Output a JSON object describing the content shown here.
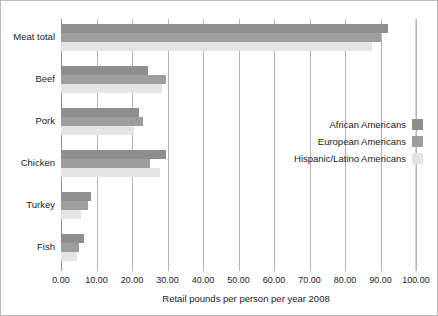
{
  "chart_data": {
    "type": "bar",
    "orientation": "horizontal",
    "title": "",
    "xlabel": "Retail pounds per person per year 2008",
    "ylabel": "",
    "xlim": [
      0,
      100
    ],
    "xticks": [
      "0.00",
      "10.00",
      "20.00",
      "30.00",
      "40.00",
      "50.00",
      "60.00",
      "70.00",
      "80.00",
      "90.00",
      "100.00"
    ],
    "grid": true,
    "legend_position": "center-right",
    "categories": [
      "Meat total",
      "Beef",
      "Pork",
      "Chicken",
      "Turkey",
      "Fish"
    ],
    "series": [
      {
        "name": "African Americans",
        "color": "#8e8e8e",
        "values": [
          92.0,
          24.5,
          22.0,
          29.5,
          8.5,
          6.5
        ]
      },
      {
        "name": "European Americans",
        "color": "#9e9e9e",
        "values": [
          90.0,
          29.5,
          23.0,
          25.0,
          7.5,
          5.0
        ]
      },
      {
        "name": "Hispanic/Latino Americans",
        "color": "#e4e4e4",
        "values": [
          87.5,
          28.5,
          20.5,
          28.0,
          5.5,
          4.5
        ]
      }
    ]
  },
  "legend": {
    "items": [
      {
        "label": "African Americans"
      },
      {
        "label": "European Americans"
      },
      {
        "label": "Hispanic/Latino Americans"
      }
    ]
  }
}
